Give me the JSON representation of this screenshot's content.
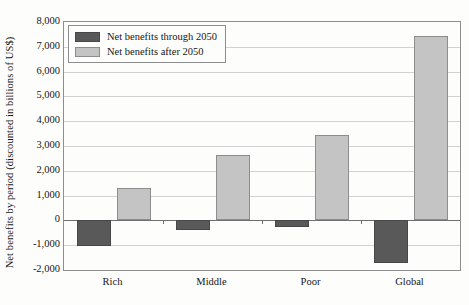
{
  "chart_data": {
    "type": "bar",
    "title": "",
    "xlabel": "",
    "ylabel": "Net benefits by period (discounted in billions of US$)",
    "categories": [
      "Rich",
      "Middle",
      "Poor",
      "Global"
    ],
    "series": [
      {
        "name": "Net benefits through 2050",
        "color": "#595959",
        "values": [
          -1020,
          -400,
          -250,
          -1700
        ]
      },
      {
        "name": "Net benefits after 2050",
        "color": "#c4c4c4",
        "values": [
          1300,
          2620,
          3450,
          7450
        ]
      }
    ],
    "ylim": [
      -2000,
      8000
    ],
    "yticks": [
      8000,
      7000,
      6000,
      5000,
      4000,
      3000,
      2000,
      1000,
      0,
      -1000,
      -2000
    ],
    "ytick_labels": [
      "8,000",
      "7,000",
      "6,000",
      "5,000",
      "4,000",
      "3,000",
      "2,000",
      "1,000",
      "0",
      "-1,000",
      "-2,000"
    ],
    "grid": true,
    "legend_position": "top-left",
    "zero_line": 0
  },
  "legend": {
    "items": [
      {
        "label": "Net benefits through 2050"
      },
      {
        "label": "Net benefits after 2050"
      }
    ]
  }
}
